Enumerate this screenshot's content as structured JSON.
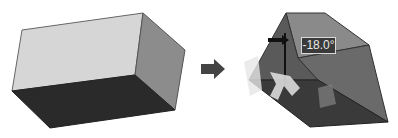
{
  "figure": {
    "before": {
      "name": "rectangular box",
      "colors": {
        "top": "#d6d6d6",
        "side": "#8c8c8c",
        "front": "#2a2a2a"
      }
    },
    "arrow": {
      "icon": "right-arrow-icon",
      "color": "#444444"
    },
    "after": {
      "name": "drafted box",
      "angle_label": "-18.0°",
      "colors": {
        "top": "#8a8a8a",
        "side": "#6a6a6a",
        "front": "#3a3a3a",
        "handle": "#dcdcdc"
      }
    }
  }
}
